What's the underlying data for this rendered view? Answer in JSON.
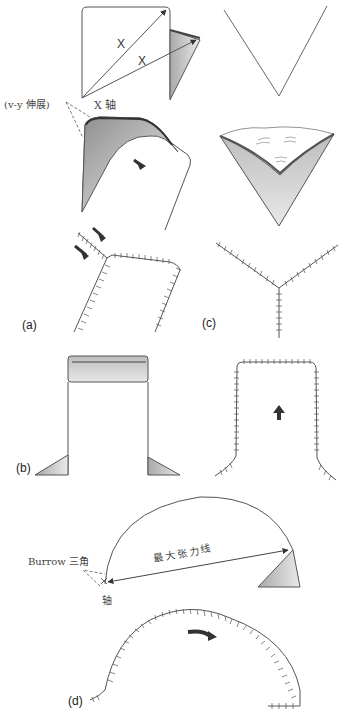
{
  "figure": {
    "panels": [
      {
        "id": "a",
        "label": "(a)"
      },
      {
        "id": "b",
        "label": "(b)"
      },
      {
        "id": "c",
        "label": "(c)"
      },
      {
        "id": "d",
        "label": "(d)"
      }
    ],
    "annotations": {
      "x_upper": "X",
      "x_lower": "X",
      "x_axis": "X 轴",
      "vy_extension": "(v-y 伸展)",
      "burrow_triangle": "Burrow 三角",
      "max_tension_line": "最大张力线",
      "pivot_axis": "轴"
    },
    "colors": {
      "line": "#555555",
      "flap_fill_light": "#e6e6e6",
      "flap_fill_dark": "#9a9a9a",
      "arrow": "#333333"
    }
  }
}
